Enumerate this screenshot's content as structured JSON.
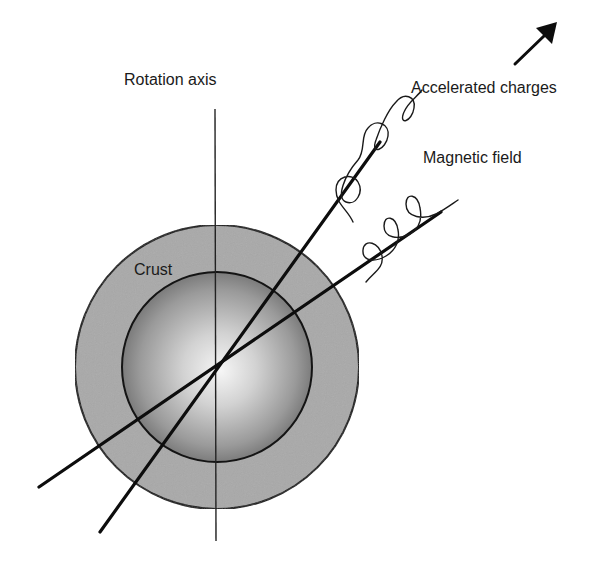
{
  "diagram": {
    "labels": {
      "rotation_axis": "Rotation axis",
      "accelerated_charges": "Accelerated charges",
      "magnetic_field": "Magnetic field",
      "crust": "Crust"
    },
    "colors": {
      "background": "#ffffff",
      "stroke": "#111111",
      "crust_fill": "#a8a8a8",
      "core_center": "#f4f4f4",
      "core_edge": "#6e6e6e"
    },
    "geometry": {
      "center": [
        217,
        367
      ],
      "outer_radius": 142,
      "inner_radius": 95,
      "rotation_axis": {
        "x": 215,
        "y1": 109,
        "y2": 541
      },
      "beam_line_steep": {
        "from": [
          100,
          532
        ],
        "to": [
          380,
          142
        ]
      },
      "beam_line_shallow": {
        "from": [
          39,
          487
        ],
        "to": [
          441,
          212
        ]
      },
      "arrow": {
        "from": [
          515,
          64
        ],
        "to": [
          557,
          22
        ]
      }
    }
  }
}
